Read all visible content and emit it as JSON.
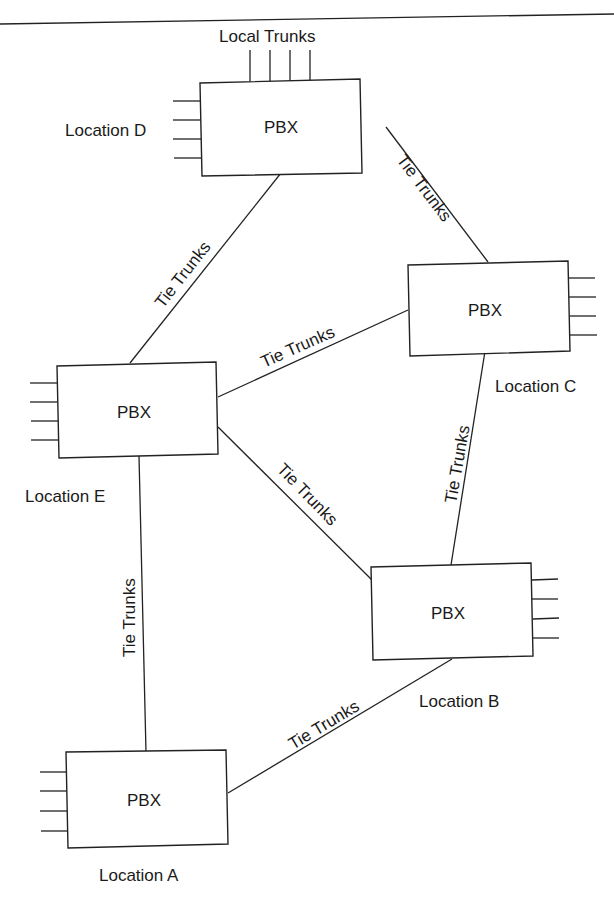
{
  "diagram": {
    "title_rule": true,
    "local_trunks_label": "Local Trunks",
    "nodes": [
      {
        "id": "D",
        "label": "PBX",
        "location": "Location D"
      },
      {
        "id": "C",
        "label": "PBX",
        "location": "Location C"
      },
      {
        "id": "E",
        "label": "PBX",
        "location": "Location E"
      },
      {
        "id": "B",
        "label": "PBX",
        "location": "Location B"
      },
      {
        "id": "A",
        "label": "PBX",
        "location": "Location A"
      }
    ],
    "edges": [
      {
        "from": "D",
        "to": "C",
        "label": "Tie Trunks"
      },
      {
        "from": "D",
        "to": "E",
        "label": "Tie Trunks"
      },
      {
        "from": "E",
        "to": "C",
        "label": "Tie Trunks"
      },
      {
        "from": "E",
        "to": "B",
        "label": "Tie Trunks"
      },
      {
        "from": "C",
        "to": "B",
        "label": "Tie Trunks"
      },
      {
        "from": "E",
        "to": "A",
        "label": "Tie Trunks"
      },
      {
        "from": "A",
        "to": "B",
        "label": "Tie Trunks"
      }
    ],
    "stroke_color": "#222222",
    "background": "#ffffff"
  }
}
